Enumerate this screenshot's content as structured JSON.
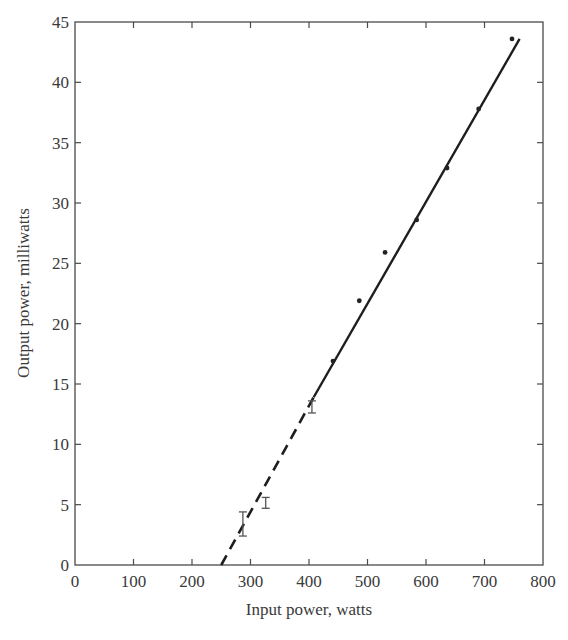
{
  "chart_data": {
    "type": "scatter",
    "title": "",
    "xlabel": "Input power, watts",
    "ylabel": "Output power, milliwatts",
    "xlim": [
      0,
      800
    ],
    "ylim": [
      0,
      45
    ],
    "xticks": [
      0,
      100,
      200,
      300,
      400,
      500,
      600,
      700,
      800
    ],
    "yticks": [
      0,
      5,
      10,
      15,
      20,
      25,
      30,
      35,
      40,
      45
    ],
    "grid": false,
    "legend": null,
    "series": [
      {
        "name": "Measured points",
        "marker": "dot",
        "x": [
          441,
          486,
          530,
          584,
          636,
          690,
          747
        ],
        "y": [
          16.9,
          21.9,
          25.9,
          28.6,
          32.9,
          37.8,
          43.6
        ]
      },
      {
        "name": "Measurements with error bars",
        "marker": "errorbar",
        "x": [
          287,
          326,
          405
        ],
        "y_low": [
          2.4,
          4.7,
          12.6
        ],
        "y_high": [
          4.4,
          5.6,
          13.6
        ]
      }
    ],
    "fit_line": {
      "solid": {
        "x": [
          408,
          760
        ],
        "y": [
          13.9,
          43.6
        ]
      },
      "dashed_extrapolation": {
        "x": [
          250,
          408
        ],
        "y": [
          0,
          13.9
        ]
      }
    }
  },
  "axes": {
    "x_title": "Input power, watts",
    "y_title": "Output power, milliwatts"
  }
}
